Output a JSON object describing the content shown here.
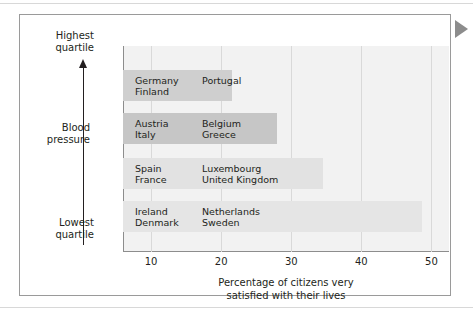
{
  "figure": {
    "pointer_icon": "right-pointing-triangle-icon"
  },
  "axes": {
    "y": {
      "top_label_line1": "Highest",
      "top_label_line2": "quartile",
      "bottom_label_line1": "Lowest",
      "bottom_label_line2": "quartile",
      "title_line1": "Blood",
      "title_line2": "pressure",
      "arrow_icon": "up-arrow-icon",
      "arrow_direction": "up"
    },
    "x": {
      "caption_line1": "Percentage of citizens very",
      "caption_line2": "satisfied with their lives",
      "tick_labels": [
        "10",
        "20",
        "30",
        "40",
        "50"
      ]
    }
  },
  "chart_data": {
    "type": "bar",
    "orientation": "horizontal",
    "title": "",
    "subtitle": "",
    "xlabel": "Percentage of citizens very satisfied with their lives",
    "ylabel": "Blood pressure",
    "xlim": [
      6,
      52.5
    ],
    "ylim_labels": [
      "Lowest quartile",
      "Highest quartile"
    ],
    "grid": true,
    "grid_axis": "x",
    "legend": "none",
    "xticks": [
      10,
      20,
      30,
      40,
      50
    ],
    "categories": [
      "Highest quartile",
      "Second quartile",
      "Third quartile",
      "Lowest quartile"
    ],
    "values": [
      21.5,
      28.0,
      34.5,
      48.7
    ],
    "bars": [
      {
        "category": "Highest quartile",
        "value": 21.5,
        "color": "#cfcfcf",
        "countries_left": [
          "Germany",
          "Finland"
        ],
        "countries_right": [
          "Portugal"
        ]
      },
      {
        "category": "Second quartile",
        "value": 28.0,
        "color": "#c6c6c6",
        "countries_left": [
          "Austria",
          "Italy"
        ],
        "countries_right": [
          "Belgium",
          "Greece"
        ]
      },
      {
        "category": "Third quartile",
        "value": 34.5,
        "color": "#e2e2e2",
        "countries_left": [
          "Spain",
          "France"
        ],
        "countries_right": [
          "Luxembourg",
          "United Kingdom"
        ]
      },
      {
        "category": "Lowest quartile",
        "value": 48.7,
        "color": "#e5e5e5",
        "countries_left": [
          "Ireland",
          "Denmark"
        ],
        "countries_right": [
          "Netherlands",
          "Sweden"
        ]
      }
    ]
  },
  "colors": {
    "plot_background": "#f2f2f2",
    "gridline": "#d9d9d9",
    "axis_line": "#8d8d8d",
    "frame_border": "#9a9a9a",
    "text": "#231f20",
    "pointer": "#8c8c8c"
  }
}
